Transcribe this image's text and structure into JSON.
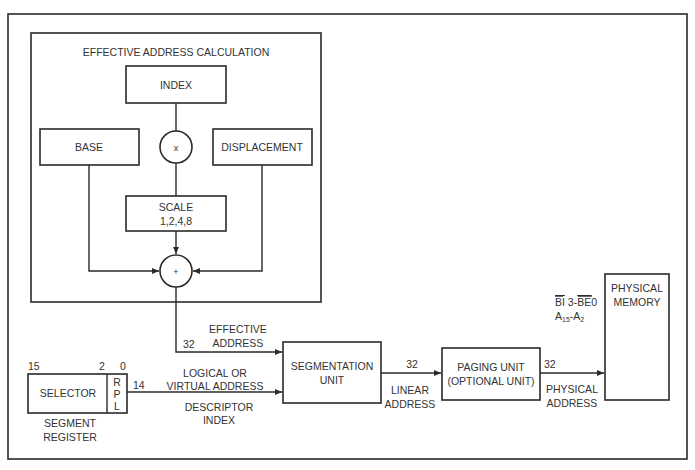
{
  "diagram": {
    "type": "block-diagram",
    "ea_group": {
      "title": "EFFECTIVE ADDRESS CALCULATION",
      "index": "INDEX",
      "base": "BASE",
      "displacement": "DISPLACEMENT",
      "multiply_symbol": "x",
      "scale_line1": "SCALE",
      "scale_line2": "1,2,4,8",
      "add_symbol": "+"
    },
    "effective_address": {
      "width": "32",
      "line1": "EFFECTIVE",
      "line2": "ADDRESS"
    },
    "segment_register": {
      "bit15": "15",
      "bit2": "2",
      "bit0": "0",
      "selector": "SELECTOR",
      "rpl": [
        "R",
        "P",
        "L"
      ],
      "caption1": "SEGMENT",
      "caption2": "REGISTER"
    },
    "logical_address": {
      "width": "14",
      "line1": "LOGICAL OR",
      "line2": "VIRTUAL ADDRESS",
      "below1": "DESCRIPTOR",
      "below2": "INDEX"
    },
    "segmentation_unit": {
      "line1": "SEGMENTATION",
      "line2": "UNIT"
    },
    "linear_address": {
      "width": "32",
      "line1": "LINEAR",
      "line2": "ADDRESS"
    },
    "paging_unit": {
      "line1": "PAGING UNIT",
      "line2": "(OPTIONAL UNIT)"
    },
    "physical_address": {
      "width": "32",
      "line1": "PHYSICAL",
      "line2": "ADDRESS"
    },
    "bus_signals": {
      "be_hi": "BI",
      "be_mid": " 3-",
      "be_lo": "BE",
      "be_end": "0",
      "a_hi": "A",
      "a_hi_sub": "15",
      "a_dash": "-A",
      "a_lo_sub": "2"
    },
    "physical_memory": {
      "line1": "PHYSICAL",
      "line2": "MEMORY"
    }
  }
}
